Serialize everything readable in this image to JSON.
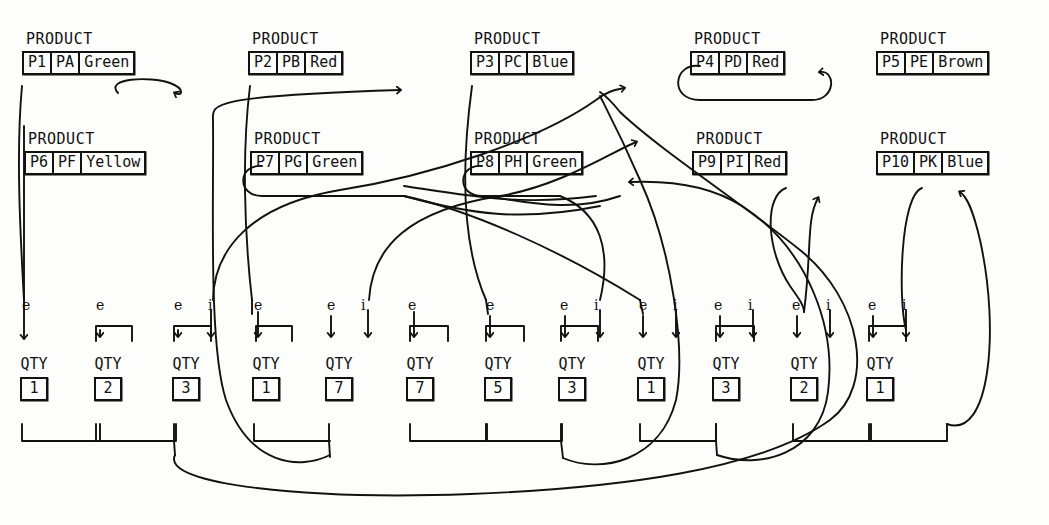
{
  "diagram": {
    "style": "hand-drawn scanned line art",
    "ink_color": "#111111",
    "paper_color": "#fdfdfb"
  },
  "products": {
    "caption": "PRODUCT",
    "row1": [
      {
        "id": "P1",
        "code": "PA",
        "color": "Green",
        "x": 22,
        "y": 32
      },
      {
        "id": "P2",
        "code": "PB",
        "color": "Red",
        "x": 248,
        "y": 32
      },
      {
        "id": "P3",
        "code": "PC",
        "color": "Blue",
        "x": 470,
        "y": 32
      },
      {
        "id": "P4",
        "code": "PD",
        "color": "Red",
        "x": 690,
        "y": 32
      },
      {
        "id": "P5",
        "code": "PE",
        "color": "Brown",
        "x": 876,
        "y": 32
      }
    ],
    "row2": [
      {
        "id": "P6",
        "code": "PF",
        "color": "Yellow",
        "x": 24,
        "y": 132
      },
      {
        "id": "P7",
        "code": "PG",
        "color": "Green",
        "x": 250,
        "y": 132
      },
      {
        "id": "P8",
        "code": "PH",
        "color": "Green",
        "x": 470,
        "y": 132
      },
      {
        "id": "P9",
        "code": "PI",
        "color": "Red",
        "x": 692,
        "y": 132
      },
      {
        "id": "P10",
        "code": "PK",
        "color": "Blue",
        "x": 876,
        "y": 132
      }
    ]
  },
  "quantities": {
    "caption": "QTY",
    "items": [
      {
        "value": "1",
        "x": 20,
        "labels": [
          "e"
        ]
      },
      {
        "value": "2",
        "x": 94,
        "labels": [
          "e"
        ]
      },
      {
        "value": "3",
        "x": 172,
        "labels": [
          "e",
          "i"
        ]
      },
      {
        "value": "1",
        "x": 252,
        "labels": [
          "e"
        ]
      },
      {
        "value": "7",
        "x": 325,
        "labels": [
          "e",
          "i"
        ]
      },
      {
        "value": "7",
        "x": 406,
        "labels": [
          "e"
        ]
      },
      {
        "value": "5",
        "x": 484,
        "labels": [
          "e"
        ]
      },
      {
        "value": "3",
        "x": 558,
        "labels": [
          "e",
          "i"
        ]
      },
      {
        "value": "1",
        "x": 637,
        "labels": [
          "e",
          "i"
        ]
      },
      {
        "value": "3",
        "x": 712,
        "labels": [
          "e",
          "i"
        ]
      },
      {
        "value": "2",
        "x": 790,
        "labels": [
          "e",
          "i"
        ]
      },
      {
        "value": "1",
        "x": 866,
        "labels": [
          "e",
          "i"
        ]
      }
    ],
    "caption_y": 357,
    "box_y": 385,
    "label_y": 298
  },
  "edge_roles": {
    "owner_pointer": "e",
    "member_pointer": "i"
  }
}
